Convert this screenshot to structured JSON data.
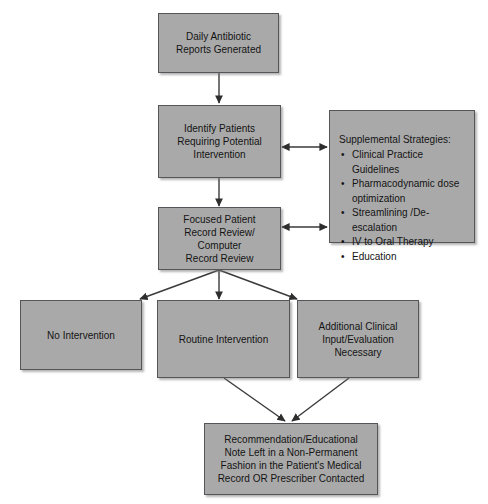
{
  "diagram": {
    "colors": {
      "node_fill": "#a9a9a9",
      "node_border": "#55565a",
      "text": "#141414",
      "background": "#ffffff",
      "edge": "#3a3a3a"
    },
    "nodes": [
      {
        "id": "daily-reports",
        "name": "daily-antibiotic-reports-node",
        "lines": [
          "Daily Antibiotic",
          "Reports Generated"
        ]
      },
      {
        "id": "identify-patients",
        "name": "identify-patients-node",
        "lines": [
          "Identify Patients",
          "Requiring Potential",
          "Intervention"
        ]
      },
      {
        "id": "supplemental",
        "name": "supplemental-strategies-node",
        "heading": "Supplemental Strategies:",
        "bullet_glyph": "•",
        "items": [
          "Clinical Practice Guidelines",
          "Pharmacodynamic dose optimization",
          "Streamlining /De-escalation",
          "IV to Oral Therapy",
          "Education"
        ]
      },
      {
        "id": "record-review",
        "name": "focused-record-review-node",
        "lines": [
          "Focused Patient",
          "Record Review/",
          "Computer",
          "Record Review"
        ]
      },
      {
        "id": "no-intervention",
        "name": "no-intervention-node",
        "lines": [
          "No Intervention"
        ]
      },
      {
        "id": "routine-intervention",
        "name": "routine-intervention-node",
        "lines": [
          "Routine Intervention"
        ]
      },
      {
        "id": "additional-clinical",
        "name": "additional-clinical-input-node",
        "lines": [
          "Additional Clinical",
          "Input/Evaluation",
          "Necessary"
        ]
      },
      {
        "id": "recommendation",
        "name": "recommendation-note-node",
        "lines": [
          "Recommendation/Educational",
          "Note Left in a Non-Permanent",
          "Fashion in the Patient's Medical",
          "Record OR Prescriber Contacted"
        ]
      }
    ],
    "edges": [
      {
        "name": "edge-daily-reports-to-identify",
        "from": "daily-reports",
        "to": "identify-patients",
        "arrow": "single"
      },
      {
        "name": "edge-identify-to-supplemental",
        "from": "identify-patients",
        "to": "supplemental",
        "arrow": "double"
      },
      {
        "name": "edge-identify-to-record-review",
        "from": "identify-patients",
        "to": "record-review",
        "arrow": "single"
      },
      {
        "name": "edge-record-review-to-supplemental",
        "from": "record-review",
        "to": "supplemental",
        "arrow": "double"
      },
      {
        "name": "edge-record-review-to-no-intervention",
        "from": "record-review",
        "to": "no-intervention",
        "arrow": "single"
      },
      {
        "name": "edge-record-review-to-routine-intervention",
        "from": "record-review",
        "to": "routine-intervention",
        "arrow": "single"
      },
      {
        "name": "edge-record-review-to-additional-clinical",
        "from": "record-review",
        "to": "additional-clinical",
        "arrow": "single"
      },
      {
        "name": "edge-routine-intervention-to-recommendation",
        "from": "routine-intervention",
        "to": "recommendation",
        "arrow": "single"
      },
      {
        "name": "edge-additional-clinical-to-recommendation",
        "from": "additional-clinical",
        "to": "recommendation",
        "arrow": "single"
      }
    ]
  }
}
